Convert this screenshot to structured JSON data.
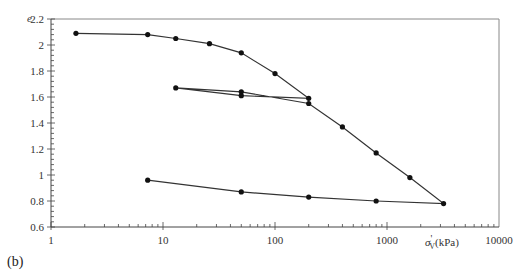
{
  "chart_data": {
    "type": "line",
    "title": "",
    "panel_label": "(b)",
    "xlabel": "σ'v (kPa)",
    "xlabel_main": "σ",
    "xlabel_prime": "'",
    "xlabel_sub": "V",
    "xlabel_unit": "(kPa)",
    "ylabel": "e",
    "xscale": "log",
    "xlim": [
      1,
      10000
    ],
    "ylim": [
      0.6,
      2.2
    ],
    "x_tick_labels": [
      "1",
      "10",
      "100",
      "1000",
      "10000"
    ],
    "x_ticks": [
      1,
      10,
      100,
      1000,
      10000
    ],
    "y_tick_labels": [
      "0.6",
      "0.8",
      "1",
      "1.2",
      "1.4",
      "1.6",
      "1.8",
      "2",
      "2.2"
    ],
    "y_ticks": [
      0.6,
      0.8,
      1.0,
      1.2,
      1.4,
      1.6,
      1.8,
      2.0,
      2.2
    ],
    "grid": false,
    "legend": null,
    "series": [
      {
        "name": "oedometer path",
        "x": [
          1.67,
          7.3,
          13,
          26,
          50,
          100,
          200,
          50,
          13,
          50,
          200,
          400,
          800,
          1600,
          3200,
          800,
          200,
          50,
          7.3
        ],
        "y": [
          2.09,
          2.08,
          2.05,
          2.01,
          1.94,
          1.78,
          1.59,
          1.61,
          1.67,
          1.64,
          1.55,
          1.37,
          1.17,
          0.98,
          0.78,
          0.8,
          0.83,
          0.87,
          0.96
        ]
      }
    ]
  },
  "colors": {
    "line": "#333333",
    "marker": "#111111",
    "frame": "#888888",
    "axis": "#444444"
  }
}
